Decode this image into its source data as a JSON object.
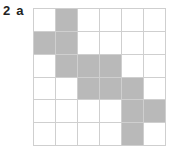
{
  "question": {
    "number": "2",
    "part": "a"
  },
  "grid": {
    "rows": 6,
    "cols": 6,
    "shaded_color": "#b9b9b9",
    "line_color": "#cfcfcf",
    "shaded": [
      [
        0,
        1,
        0,
        0,
        0,
        0
      ],
      [
        1,
        1,
        0,
        0,
        0,
        0
      ],
      [
        0,
        1,
        1,
        1,
        0,
        0
      ],
      [
        0,
        0,
        1,
        1,
        1,
        0
      ],
      [
        0,
        0,
        0,
        0,
        1,
        1
      ],
      [
        0,
        0,
        0,
        0,
        1,
        0
      ]
    ]
  }
}
